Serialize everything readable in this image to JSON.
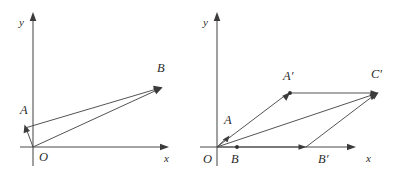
{
  "figure": {
    "kind": "vector-geometry-diagram",
    "background_color": "#ffffff",
    "stroke_color": "#4a4a4a",
    "label_color": "#2b2b2b",
    "panels": [
      {
        "id": "left",
        "name": "vector-triangle-OAB",
        "origin_label": "O",
        "axis_x_label": "x",
        "axis_y_label": "y",
        "origin_px": {
          "x": 33,
          "y": 147
        },
        "points": [
          {
            "name": "A",
            "label": "A",
            "px": {
              "x": 25,
              "y": 127
            },
            "label_px": {
              "x": 21,
              "y": 114
            }
          },
          {
            "name": "B",
            "label": "B",
            "px": {
              "x": 162,
              "y": 88
            },
            "label_px": {
              "x": 159,
              "y": 74
            }
          }
        ],
        "vectors": [
          {
            "name": "OA",
            "from": "O",
            "to": "A",
            "arrow": true
          },
          {
            "name": "OB",
            "from": "O",
            "to": "B",
            "arrow": true
          },
          {
            "name": "AB",
            "from": "A",
            "to": "B",
            "arrow": true
          }
        ],
        "axis_x_px": {
          "x1": 20,
          "y1": 147,
          "x2": 168,
          "y2": 147
        },
        "axis_y_px": {
          "x1": 33,
          "y1": 166,
          "x2": 33,
          "y2": 14
        },
        "axis_x_label_px": {
          "x": 165,
          "y": 162
        },
        "axis_y_label_px": {
          "x": 20,
          "y": 24
        },
        "origin_label_px": {
          "x": 40,
          "y": 161
        }
      },
      {
        "id": "right",
        "name": "parallelogram-OA-prime-C-prime-B-prime",
        "origin_label": "O",
        "axis_x_label": "x",
        "axis_y_label": "y",
        "origin_px": {
          "x": 217,
          "y": 147
        },
        "points": [
          {
            "name": "A",
            "label": "A",
            "px": {
              "x": 228,
              "y": 137
            },
            "label_px": {
              "x": 226,
              "y": 122
            }
          },
          {
            "name": "B",
            "label": "B",
            "px": {
              "x": 237,
              "y": 147
            },
            "label_px": {
              "x": 233,
              "y": 162
            }
          },
          {
            "name": "A'",
            "label": "A′",
            "px": {
              "x": 290,
              "y": 93
            },
            "label_px": {
              "x": 286,
              "y": 79
            }
          },
          {
            "name": "B'",
            "label": "B′",
            "px": {
              "x": 306,
              "y": 147
            },
            "label_px": {
              "x": 322,
              "y": 162
            }
          },
          {
            "name": "C'",
            "label": "C′",
            "px": {
              "x": 378,
              "y": 93
            },
            "label_px": {
              "x": 374,
              "y": 77
            }
          }
        ],
        "vectors": [
          {
            "name": "OA",
            "from": "O",
            "to": "A",
            "arrow": true
          },
          {
            "name": "OA-prime",
            "from": "O",
            "to": "A'",
            "arrow": true
          },
          {
            "name": "OB-prime",
            "from": "O",
            "to": "B'",
            "arrow": true
          },
          {
            "name": "OC-prime",
            "from": "O",
            "to": "C'",
            "arrow": true
          },
          {
            "name": "A-prime-C-prime",
            "from": "A'",
            "to": "C'",
            "arrow": true
          },
          {
            "name": "B-prime-C-prime",
            "from": "B'",
            "to": "C'",
            "arrow": true
          }
        ],
        "axis_x_px": {
          "x1": 200,
          "y1": 147,
          "x2": 355,
          "y2": 147
        },
        "axis_y_px": {
          "x1": 217,
          "y1": 166,
          "x2": 217,
          "y2": 14
        },
        "axis_x_label_px": {
          "x": 368,
          "y": 162
        },
        "axis_y_label_px": {
          "x": 204,
          "y": 24
        },
        "origin_label_px": {
          "x": 203,
          "y": 162
        }
      }
    ]
  }
}
